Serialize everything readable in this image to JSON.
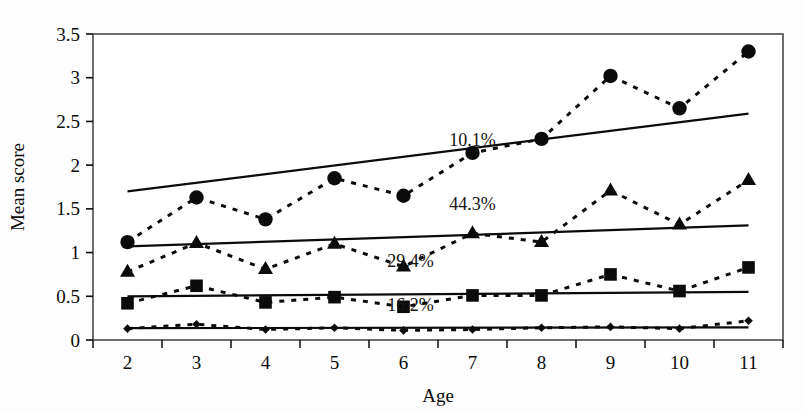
{
  "chart_data": {
    "type": "line",
    "title": "",
    "xlabel": "Age",
    "ylabel": "Mean score",
    "categories": [
      2,
      3,
      4,
      5,
      6,
      7,
      8,
      9,
      10,
      11
    ],
    "xlim": [
      1.5,
      11.5
    ],
    "ylim": [
      0,
      3.5
    ],
    "ytick_labels": [
      "0",
      "0.5",
      "1",
      "1.5",
      "2",
      "2.5",
      "3",
      "3.5"
    ],
    "ytick_values": [
      0,
      0.5,
      1,
      1.5,
      2,
      2.5,
      3,
      3.5
    ],
    "xtick_labels": [
      "2",
      "3",
      "4",
      "5",
      "6",
      "7",
      "8",
      "9",
      "10",
      "11"
    ],
    "grid": false,
    "legend": "none",
    "series": [
      {
        "name": "series-circle",
        "marker": "circle",
        "line_style": "dashed",
        "values": [
          1.12,
          1.63,
          1.38,
          1.85,
          1.65,
          2.14,
          2.3,
          3.02,
          2.65,
          3.3
        ],
        "trendline": {
          "label": "10.1%",
          "label_x": 7.0,
          "label_y": 2.22,
          "y_start": 1.7,
          "y_end": 2.59
        }
      },
      {
        "name": "series-triangle",
        "marker": "triangle",
        "line_style": "dashed",
        "values": [
          0.78,
          1.11,
          0.81,
          1.1,
          0.84,
          1.22,
          1.12,
          1.71,
          1.32,
          1.83
        ],
        "trendline": {
          "label": "44.3%",
          "label_x": 7.0,
          "label_y": 1.49,
          "y_start": 1.07,
          "y_end": 1.31
        }
      },
      {
        "name": "series-square",
        "marker": "square",
        "line_style": "dashed",
        "values": [
          0.42,
          0.62,
          0.43,
          0.49,
          0.38,
          0.51,
          0.51,
          0.75,
          0.56,
          0.83
        ],
        "trendline": {
          "label": "29.4%",
          "label_x": 6.1,
          "label_y": 0.84,
          "y_start": 0.5,
          "y_end": 0.55
        }
      },
      {
        "name": "series-diamond",
        "marker": "diamond",
        "line_style": "dashed",
        "values": [
          0.13,
          0.18,
          0.12,
          0.14,
          0.11,
          0.12,
          0.14,
          0.15,
          0.13,
          0.22
        ],
        "trendline": {
          "label": "16.2%",
          "label_x": 6.1,
          "label_y": 0.33,
          "y_start": 0.135,
          "y_end": 0.145
        }
      }
    ],
    "annotations": [
      "10.1%",
      "44.3%",
      "29.4%",
      "16.2%"
    ],
    "colors": {
      "ink": "#0b0b0b",
      "frame": "#4a4a4a",
      "background": "#ffffff"
    }
  }
}
